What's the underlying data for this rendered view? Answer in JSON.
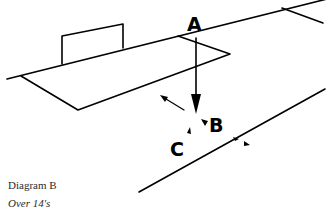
{
  "diagram": {
    "title": "Diagram B",
    "subtitle": "Over 14's",
    "labels": {
      "a": "A",
      "b": "B",
      "c": "C"
    },
    "stroke_color": "#000000",
    "background": "#ffffff"
  }
}
